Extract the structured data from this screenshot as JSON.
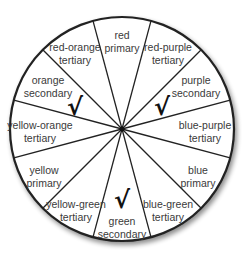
{
  "wheel": {
    "center": [
      122,
      129
    ],
    "radius": 112,
    "segments": [
      {
        "name": "red",
        "label": "red",
        "type": "primary",
        "pos": [
          122,
          42
        ],
        "checked": false
      },
      {
        "name": "red-purple",
        "label": "red-purple",
        "type": "tertiary",
        "pos": [
          168,
          54
        ],
        "checked": false
      },
      {
        "name": "purple",
        "label": "purple",
        "type": "secondary",
        "pos": [
          196,
          87
        ],
        "checked": true
      },
      {
        "name": "blue-purple",
        "label": "blue-purple",
        "type": "tertiary",
        "pos": [
          205,
          132
        ],
        "checked": false
      },
      {
        "name": "blue",
        "label": "blue",
        "type": "primary",
        "pos": [
          198,
          177
        ],
        "checked": false
      },
      {
        "name": "blue-green",
        "label": "blue-green",
        "type": "tertiary",
        "pos": [
          168,
          211
        ],
        "checked": false
      },
      {
        "name": "green",
        "label": "green",
        "type": "secondary",
        "pos": [
          122,
          228
        ],
        "checked": true
      },
      {
        "name": "yellow-green",
        "label": "yellow-green",
        "type": "tertiary",
        "pos": [
          76,
          211
        ],
        "checked": false
      },
      {
        "name": "yellow",
        "label": "yellow",
        "type": "primary",
        "pos": [
          44,
          177
        ],
        "checked": false
      },
      {
        "name": "yellow-orange",
        "label": "yellow-orange",
        "type": "tertiary",
        "pos": [
          40,
          132
        ],
        "checked": false
      },
      {
        "name": "orange",
        "label": "orange",
        "type": "secondary",
        "pos": [
          48,
          87
        ],
        "checked": true
      },
      {
        "name": "red-orange",
        "label": "red-orange",
        "type": "tertiary",
        "pos": [
          75,
          54
        ],
        "checked": false
      }
    ],
    "checkmarks": [
      {
        "symbol": "√",
        "pos": [
          75,
          107
        ]
      },
      {
        "symbol": "√",
        "pos": [
          162,
          107
        ]
      },
      {
        "symbol": "√",
        "pos": [
          122,
          200
        ]
      }
    ]
  }
}
